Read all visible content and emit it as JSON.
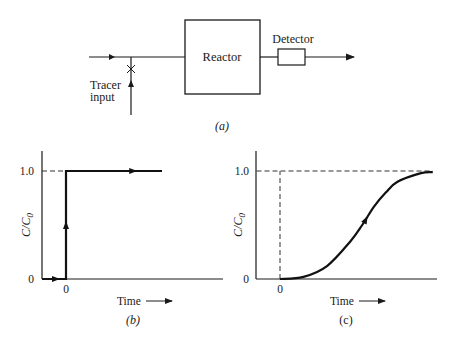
{
  "panel_a": {
    "reactor_label": "Reactor",
    "detector_label": "Detector",
    "tracer_label_line1": "Tracer",
    "tracer_label_line2": "input",
    "caption": "(a)"
  },
  "chart_data": [
    {
      "type": "line",
      "panel": "b",
      "caption": "(b)",
      "xlabel": "Time",
      "ylabel": "C/C0",
      "ytick_labels": [
        "0",
        "1.0"
      ],
      "xtick_labels": [
        "0"
      ],
      "yticks": [
        0,
        1.0
      ],
      "xticks": [
        0
      ],
      "xlim": [
        -1,
        5.5
      ],
      "ylim": [
        0,
        1.2
      ],
      "series": [
        {
          "name": "step response",
          "x": [
            -1,
            0,
            0,
            4
          ],
          "y": [
            0,
            0,
            1.0,
            1.0
          ]
        }
      ],
      "reference_lines": [
        {
          "type": "horizontal-dashed",
          "y": 1.0,
          "x_from": -1,
          "x_to": 0
        }
      ]
    },
    {
      "type": "line",
      "panel": "c",
      "caption": "(c)",
      "xlabel": "Time",
      "ylabel": "C/C0",
      "ytick_labels": [
        "0",
        "1.0"
      ],
      "xtick_labels": [
        "0"
      ],
      "yticks": [
        0,
        1.0
      ],
      "xticks": [
        0
      ],
      "xlim": [
        -1,
        7.5
      ],
      "ylim": [
        0,
        1.2
      ],
      "series": [
        {
          "name": "S-shaped response",
          "x": [
            0,
            1,
            2,
            3,
            3.5,
            4,
            4.5,
            5,
            6,
            6.5
          ],
          "y": [
            0,
            0.02,
            0.12,
            0.35,
            0.5,
            0.67,
            0.8,
            0.9,
            0.98,
            0.99
          ]
        }
      ],
      "reference_lines": [
        {
          "type": "horizontal-dashed",
          "y": 1.0,
          "x_from": -1,
          "x_to": 6.5
        },
        {
          "type": "vertical-dashed",
          "x": 0,
          "y_from": 0,
          "y_to": 1.0
        }
      ]
    }
  ]
}
